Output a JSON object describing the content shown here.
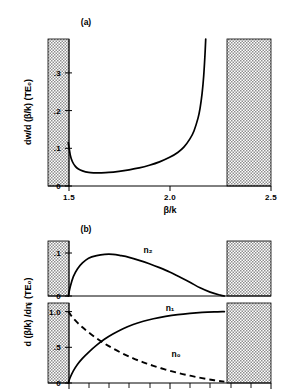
{
  "figure": {
    "background_color": "#ffffff",
    "line_color": "#000000",
    "hatch_color": "#9a9a9a"
  },
  "panels": [
    {
      "id": "a",
      "label": "(a)",
      "ylabel": "dw/d (β/k) (TE₀)",
      "xlabel": "β/k",
      "xticks": [
        "1.5",
        "2.0",
        "2.5"
      ],
      "yticks": [
        "0",
        ".1",
        ".2",
        ".3"
      ]
    },
    {
      "id": "b",
      "label": "(b)",
      "ylabel": "d (β/k) /dnⱼ (TE₀)",
      "yticks_upper": [
        "0",
        ".1"
      ],
      "yticks_lower": [
        "0",
        ".5",
        "1.0"
      ],
      "curve_labels": [
        "n₂",
        "n₁",
        "n₀"
      ]
    }
  ],
  "chart_data": [
    {
      "type": "line",
      "panel": "a",
      "title": "(a)",
      "xlabel": "β/k",
      "ylabel": "dw/d (β/k) (TE₀)",
      "xlim": [
        1.4,
        2.5
      ],
      "ylim": [
        0,
        0.39
      ],
      "xticks": [
        1.5,
        2.0,
        2.5
      ],
      "xtick_labels": [
        "1.5",
        "2.0",
        "2.5"
      ],
      "yticks": [
        0,
        0.1,
        0.2,
        0.3
      ],
      "ytick_labels": [
        "0",
        ".1",
        ".2",
        ".3"
      ],
      "grid": false,
      "legend": null,
      "shaded_regions": [
        {
          "x0": 1.4,
          "x1": 1.5,
          "style": "hatched"
        },
        {
          "x0": 2.27,
          "x1": 2.5,
          "style": "hatched"
        }
      ],
      "series": [
        {
          "name": "dw/d(beta/k)",
          "style": "solid",
          "x": [
            1.5,
            1.51,
            1.52,
            1.535,
            1.55,
            1.57,
            1.6,
            1.63,
            1.66,
            1.7,
            1.75,
            1.8,
            1.85,
            1.9,
            1.95,
            2.0,
            2.04,
            2.07,
            2.1,
            2.12,
            2.14,
            2.15,
            2.16,
            2.168,
            2.174,
            2.178
          ],
          "y": [
            0.115,
            0.082,
            0.065,
            0.052,
            0.045,
            0.04,
            0.036,
            0.035,
            0.035,
            0.036,
            0.039,
            0.043,
            0.048,
            0.055,
            0.064,
            0.076,
            0.089,
            0.103,
            0.125,
            0.146,
            0.18,
            0.206,
            0.245,
            0.292,
            0.345,
            0.39
          ]
        }
      ]
    },
    {
      "type": "line",
      "panel": "b-upper",
      "title": "(b)",
      "xlabel": "β/k",
      "ylabel": "d (β/k) /dnⱼ (TE₀)",
      "xlim": [
        1.4,
        2.5
      ],
      "ylim": [
        0,
        0.128
      ],
      "yticks": [
        0,
        0.1
      ],
      "ytick_labels": [
        "0",
        ".1"
      ],
      "grid": false,
      "shaded_regions": [
        {
          "x0": 1.4,
          "x1": 1.5,
          "style": "hatched"
        },
        {
          "x0": 2.27,
          "x1": 2.5,
          "style": "hatched"
        }
      ],
      "series": [
        {
          "name": "n₂",
          "style": "solid",
          "label_x": 1.95,
          "label_y": 0.095,
          "x": [
            1.5,
            1.51,
            1.525,
            1.545,
            1.57,
            1.6,
            1.64,
            1.68,
            1.72,
            1.76,
            1.8,
            1.85,
            1.9,
            1.95,
            2.0,
            2.05,
            2.1,
            2.15,
            2.2,
            2.25,
            2.27
          ],
          "y": [
            0.0,
            0.022,
            0.045,
            0.063,
            0.077,
            0.088,
            0.094,
            0.097,
            0.097,
            0.094,
            0.09,
            0.083,
            0.075,
            0.066,
            0.056,
            0.044,
            0.032,
            0.019,
            0.009,
            0.002,
            0.0
          ]
        }
      ]
    },
    {
      "type": "line",
      "panel": "b-lower",
      "xlabel": "β/k",
      "ylabel": "d (β/k) /dnⱼ (TE₀)",
      "xlim": [
        1.4,
        2.5
      ],
      "ylim": [
        0,
        1.12
      ],
      "yticks": [
        0,
        0.5,
        1.0
      ],
      "ytick_labels": [
        "0",
        ".5",
        "1.0"
      ],
      "grid": false,
      "shaded_regions": [
        {
          "x0": 1.4,
          "x1": 1.5,
          "style": "hatched"
        },
        {
          "x0": 2.27,
          "x1": 2.5,
          "style": "hatched"
        }
      ],
      "series": [
        {
          "name": "n₁",
          "style": "solid",
          "label_x": 2.0,
          "label_y": 1.02,
          "x": [
            1.5,
            1.51,
            1.525,
            1.545,
            1.57,
            1.6,
            1.64,
            1.68,
            1.72,
            1.77,
            1.82,
            1.87,
            1.92,
            1.98,
            2.04,
            2.1,
            2.16,
            2.22,
            2.27
          ],
          "y": [
            0.0,
            0.08,
            0.17,
            0.26,
            0.345,
            0.43,
            0.53,
            0.615,
            0.685,
            0.76,
            0.82,
            0.865,
            0.9,
            0.932,
            0.957,
            0.975,
            0.988,
            0.996,
            1.0
          ]
        },
        {
          "name": "n₀",
          "style": "dashed",
          "label_x": 2.03,
          "label_y": 0.3,
          "x": [
            1.5,
            1.51,
            1.525,
            1.545,
            1.57,
            1.6,
            1.64,
            1.68,
            1.72,
            1.77,
            1.82,
            1.87,
            1.92,
            1.98,
            2.04,
            2.1,
            2.16,
            2.22,
            2.27
          ],
          "y": [
            1.0,
            0.96,
            0.905,
            0.845,
            0.78,
            0.71,
            0.625,
            0.55,
            0.485,
            0.41,
            0.345,
            0.29,
            0.24,
            0.188,
            0.142,
            0.103,
            0.068,
            0.038,
            0.02
          ]
        }
      ]
    }
  ]
}
